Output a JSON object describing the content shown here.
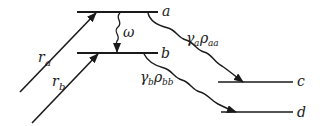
{
  "diagram": {
    "levels": {
      "a": {
        "label": "a"
      },
      "b": {
        "label": "b"
      },
      "c": {
        "label": "c"
      },
      "d": {
        "label": "d"
      }
    },
    "pumps": {
      "ra": {
        "label_main": "r",
        "label_sub": "a"
      },
      "rb": {
        "label_main": "r",
        "label_sub": "b"
      }
    },
    "coupling": {
      "label": "ω"
    },
    "decays": {
      "a": {
        "gamma": "γ",
        "gamma_sub": "a",
        "rho": "ρ",
        "rho_sub": "aa"
      },
      "b": {
        "gamma": "γ",
        "gamma_sub": "b",
        "rho": "ρ",
        "rho_sub": "bb"
      }
    },
    "colors": {
      "ink": "#1a1a1a",
      "background": "#ffffff"
    }
  }
}
